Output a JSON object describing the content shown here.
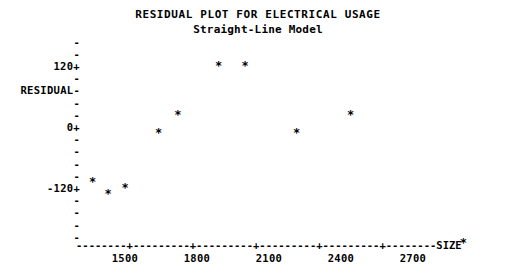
{
  "chart_data": {
    "type": "scatter",
    "title": "RESIDUAL PLOT FOR ELECTRICAL USAGE",
    "subtitle": "Straight-Line Model",
    "xlabel": "SIZE",
    "ylabel": "RESIDUAL",
    "marker": "*",
    "grid": false,
    "legend": null,
    "xlim": [
      1280,
      2980
    ],
    "ylim": [
      -240,
      168
    ],
    "x_ticks": [
      1500,
      1800,
      2100,
      2400,
      2700
    ],
    "x_tick_labels": [
      "1500",
      "1800",
      "2100",
      "2400",
      "2700"
    ],
    "y_ticks": [
      120,
      0,
      -120
    ],
    "y_tick_labels": [
      "120+",
      "0+",
      "-120+"
    ],
    "y_minor_tick_glyph": "-",
    "x_axis_glyph": "-",
    "x_tick_glyph": "+",
    "points": [
      {
        "x": 1640,
        "y": -12
      },
      {
        "x": 1720,
        "y": 24
      },
      {
        "x": 1890,
        "y": 120
      },
      {
        "x": 2000,
        "y": 120
      },
      {
        "x": 2215,
        "y": -12
      },
      {
        "x": 2440,
        "y": 24
      },
      {
        "x": 1365,
        "y": -108
      },
      {
        "x": 1430,
        "y": -132
      },
      {
        "x": 1500,
        "y": -120
      },
      {
        "x": 2910,
        "y": -228
      }
    ]
  },
  "axes": {
    "y_axis_rows": [
      {
        "label": "-",
        "value": 168
      },
      {
        "label": "-",
        "value": 144
      },
      {
        "label": "120+",
        "value": 120
      },
      {
        "label": "-",
        "value": 96
      },
      {
        "label": "RESIDUAL-",
        "value": 72
      },
      {
        "label": "-",
        "value": 48
      },
      {
        "label": "-",
        "value": 24
      },
      {
        "label": "0+",
        "value": 0
      },
      {
        "label": "-",
        "value": -24
      },
      {
        "label": "-",
        "value": -48
      },
      {
        "label": "-",
        "value": -72
      },
      {
        "label": "-",
        "value": -96
      },
      {
        "label": "-120+",
        "value": -120
      },
      {
        "label": "-",
        "value": -144
      },
      {
        "label": "-",
        "value": -168
      },
      {
        "label": "-",
        "value": -192
      },
      {
        "label": "-",
        "value": -216
      }
    ],
    "x_axis_line": "--------+---------+---------+---------+---------+--------",
    "x_axis_end_label": "SIZE"
  }
}
